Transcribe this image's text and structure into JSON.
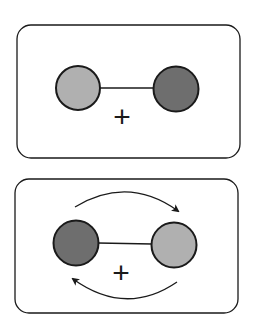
{
  "panels": [
    {
      "name": "ground-state",
      "left_atom": {
        "shade": "light",
        "color": "#b0b0b0"
      },
      "right_atom": {
        "shade": "dark",
        "color": "#6e6e6e"
      },
      "charge_label": "+",
      "exchange_arrows": false
    },
    {
      "name": "exchanged-state",
      "left_atom": {
        "shade": "dark",
        "color": "#6e6e6e"
      },
      "right_atom": {
        "shade": "light",
        "color": "#b0b0b0"
      },
      "charge_label": "+",
      "exchange_arrows": true
    }
  ],
  "colors": {
    "stroke": "#1a1a1a",
    "background": "#ffffff"
  }
}
